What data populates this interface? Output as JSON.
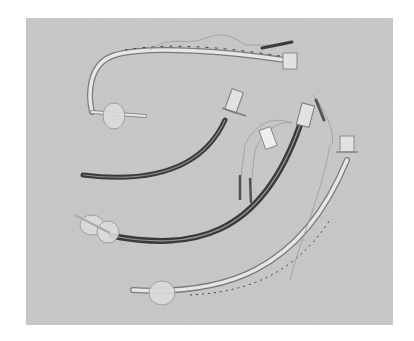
{
  "image": {
    "subject": "Four endotracheal tubes on a gray background",
    "style": "grayscale photograph",
    "colors": {
      "page_background": "#ffffff",
      "photo_background": "#c9c9c9",
      "tube_dark": "#3a3a3a",
      "tube_light": "#e6e6e6",
      "tube_outline": "#7a7a7a",
      "cuff": "#dcdcdc",
      "connector": "#e2e2e2"
    },
    "objects": [
      {
        "name": "tube-1",
        "description": "clear curved tube with cuff, pilot line and connector (top)"
      },
      {
        "name": "tube-2",
        "description": "dark reinforced tube with connector (middle left)"
      },
      {
        "name": "tube-3",
        "description": "dark double-lumen tube with two cuffs, pilot lines and label tag"
      },
      {
        "name": "tube-4",
        "description": "clear tube with cuff and pilot line (bottom)"
      }
    ]
  }
}
